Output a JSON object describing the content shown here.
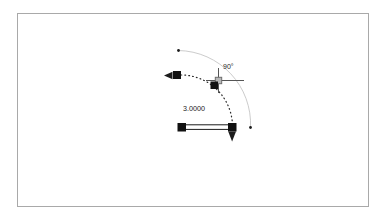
{
  "page": {
    "background": "#ffffff",
    "width": 385,
    "height": 219
  },
  "frame": {
    "border_color": "#a9a9a9",
    "fill": "#ffffff"
  },
  "drawing": {
    "angle_label": "90°",
    "length_label": "3.0000",
    "colors": {
      "ink": "#1c1c1c",
      "preview_arc": "#cccccc",
      "dashed_arc": "#2a2a2a",
      "crosshair": "#555555",
      "pickbox_fill": "#b8b8b8",
      "pickbox_border": "#6e6e6e",
      "grip_fill": "#111111"
    },
    "icons": [
      {
        "name": "arrowhead-left-icon",
        "shape": "left-filled-triangle"
      },
      {
        "name": "arrowhead-down-icon",
        "shape": "down-filled-triangle"
      },
      {
        "name": "grip-icon",
        "shape": "filled-square"
      },
      {
        "name": "crosshair-icon",
        "shape": "plus-cross-with-pickbox"
      },
      {
        "name": "defpoint-icon",
        "shape": "small-dot"
      }
    ]
  }
}
